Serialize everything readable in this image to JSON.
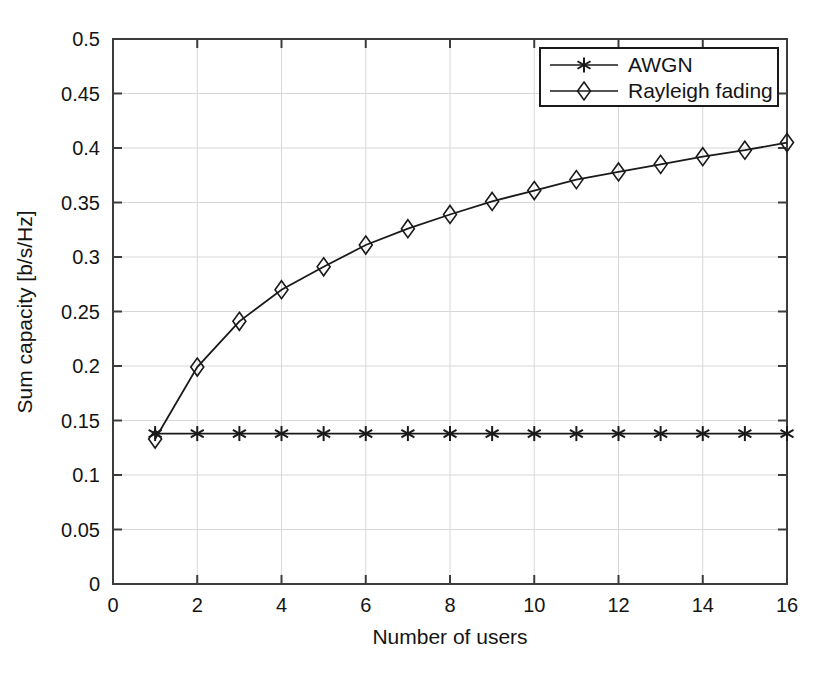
{
  "chart_data": {
    "type": "line",
    "title": "",
    "xlabel": "Number of users",
    "ylabel": "Sum capacity [b/s/Hz]",
    "xlim": [
      0,
      16
    ],
    "ylim": [
      0,
      0.5
    ],
    "grid": true,
    "legend_position": "top-right",
    "xticks": [
      0,
      2,
      4,
      6,
      8,
      10,
      12,
      14,
      16
    ],
    "xtick_labels": [
      "0",
      "2",
      "4",
      "6",
      "8",
      "10",
      "12",
      "14",
      "16"
    ],
    "yticks": [
      0,
      0.05,
      0.1,
      0.15,
      0.2,
      0.25,
      0.3,
      0.35,
      0.4,
      0.45,
      0.5
    ],
    "ytick_labels": [
      "0",
      "0.05",
      "0.1",
      "0.15",
      "0.2",
      "0.25",
      "0.3",
      "0.35",
      "0.4",
      "0.45",
      "0.5"
    ],
    "x": [
      1,
      2,
      3,
      4,
      5,
      6,
      7,
      8,
      9,
      10,
      11,
      12,
      13,
      14,
      15,
      16
    ],
    "series": [
      {
        "name": "AWGN",
        "marker": "asterisk",
        "color": "#1a1a1a",
        "values": [
          0.138,
          0.138,
          0.138,
          0.138,
          0.138,
          0.138,
          0.138,
          0.138,
          0.138,
          0.138,
          0.138,
          0.138,
          0.138,
          0.138,
          0.138,
          0.138
        ]
      },
      {
        "name": "Rayleigh fading",
        "marker": "diamond",
        "color": "#1a1a1a",
        "values": [
          0.133,
          0.199,
          0.241,
          0.27,
          0.291,
          0.311,
          0.326,
          0.339,
          0.351,
          0.361,
          0.371,
          0.378,
          0.385,
          0.392,
          0.398,
          0.405
        ]
      }
    ]
  },
  "legend": {
    "entries": [
      {
        "label": "AWGN",
        "marker": "asterisk"
      },
      {
        "label": "Rayleigh fading",
        "marker": "diamond"
      }
    ]
  },
  "axes": {
    "x_title": "Number of users",
    "y_title": "Sum capacity [b/s/Hz]"
  }
}
